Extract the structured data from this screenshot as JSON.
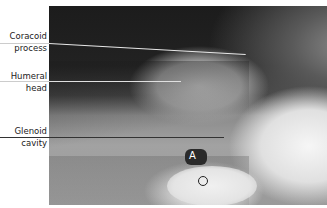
{
  "figure": {
    "type": "radiograph",
    "labels": [
      {
        "line1": "Coracoid",
        "line2": "process"
      },
      {
        "line1": "Humeral",
        "line2": "head"
      },
      {
        "line1": "Glenoid",
        "line2": "cavity"
      }
    ],
    "markers": {
      "a": "A",
      "o": "O"
    },
    "colors": {
      "label_text": "#222222",
      "pointer_light": "#e8e8e8",
      "pointer_dark": "#333333",
      "background": "#ffffff"
    }
  }
}
